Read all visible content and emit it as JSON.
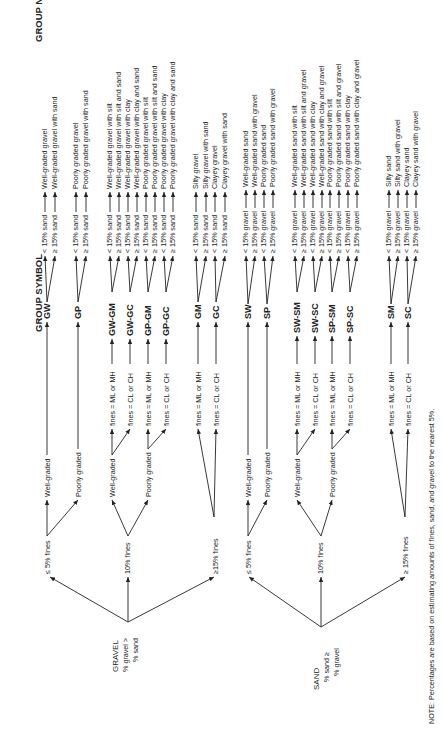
{
  "headers": {
    "group_symbol": "GROUP SYMBOL",
    "group_name": "GROUP NAME"
  },
  "note": "NOTE: Percentages are based on estimating amounts of fines, sand, and gravel to the nearest 5%.",
  "gravel": {
    "root": {
      "title": "GRAVEL",
      "line1": "% gravel  >",
      "line2": "% sand"
    },
    "fines": {
      "low": "≤ 5% fines",
      "mid": "10% fines",
      "high": "≥15% fines"
    },
    "grading": {
      "well": "Well-graded",
      "poor": "Poorly graded",
      "well2": "Well-graded",
      "poor2": "Poorly graded"
    },
    "fines_types": {
      "mlmh": "fines = ML or MH",
      "clch": "fines = CL or CH"
    },
    "symbols": [
      "GW",
      "GP",
      "GW-GM",
      "GW-GC",
      "GP-GM",
      "GP-GC",
      "GM",
      "GC"
    ],
    "conditions": {
      "lt": "< 15% sand",
      "ge": "≥ 15% sand"
    },
    "names": [
      "Well-graded gravel",
      "Well-graded gravel with sand",
      "Poorly graded gravel",
      "Poorly graded gravel with sand",
      "Well-graded gravel with silt",
      "Well-graded gravel with silt and sand",
      "Well-graded gravel with clay",
      "Well-graded gravel with clay and sand",
      "Poorly graded gravel with silt",
      "Poorly graded gravel with silt and sand",
      "Poorly graded gravel with clay",
      "Poorly graded gravel with clay and sand",
      "Silty gravel",
      "Silty gravel with sand",
      "Clayey gravel",
      "Clayey gravel with sand"
    ]
  },
  "sand": {
    "root": {
      "title": "SAND",
      "line1": "% sand  ≥",
      "line2": "% gravel"
    },
    "fines": {
      "low": "≤ 5% fines",
      "mid": "10% fines",
      "high": "≥ 15% fines"
    },
    "grading": {
      "well": "Well-graded",
      "poor": "Poorly graded",
      "well2": "Well-graded",
      "poor2": "Poorly graded"
    },
    "fines_types": {
      "mlmh": "fines = ML or MH",
      "clch": "fines = CL or CH"
    },
    "symbols": [
      "SW",
      "SP",
      "SW-SM",
      "SW-SC",
      "SP-SM",
      "SP-SC",
      "SM",
      "SC"
    ],
    "conditions": {
      "lt": "< 15% gravel",
      "ge": "≥ 15% gravel"
    },
    "names": [
      "Well-graded sand",
      "Well-graded sand with gravel",
      "Poorly graded sand",
      "Poorly graded sand with gravel",
      "Well-graded sand with silt",
      "Well-graded sand with silt and gravel",
      "Well-graded sand with clay",
      "Well-graded sand with clay and gravel",
      "Poorly graded sand with silt",
      "Poorly graded sand with silt and gravel",
      "Poorly graded sand with clay",
      "Poorly graded sand with clay and gravel",
      "Silty sand",
      "Silty sand with gravel",
      "Clayey sand",
      "Clayey sand with gravel"
    ]
  }
}
